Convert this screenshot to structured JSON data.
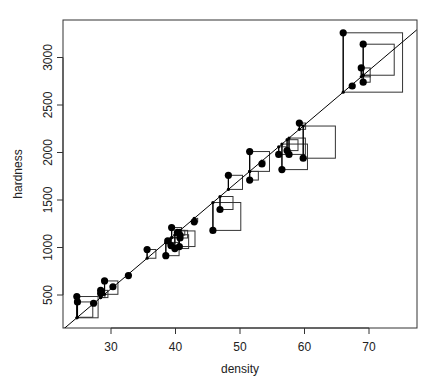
{
  "chart_data": {
    "type": "scatter",
    "title": "",
    "xlabel": "density",
    "ylabel": "hardness",
    "xlim": [
      22.7,
      77.4
    ],
    "ylim": [
      160,
      3345
    ],
    "x_ticks": [
      30,
      40,
      50,
      60,
      70
    ],
    "y_ticks": [
      500,
      1000,
      1500,
      2000,
      2500,
      3000
    ],
    "grid": false,
    "legend": null,
    "regression_line": {
      "intercept": -1160.5,
      "slope": 57.51
    },
    "annotations": "Squared residuals drawn as squares from each observed point to the fitted line; small dots mark fitted values on the line",
    "series": [
      {
        "name": "observations",
        "x": [
          24.7,
          24.8,
          27.3,
          28.4,
          28.4,
          29.0,
          30.3,
          32.7,
          35.6,
          38.5,
          38.8,
          39.3,
          39.4,
          39.9,
          40.3,
          40.6,
          40.7,
          40.7,
          42.9,
          45.8,
          46.9,
          48.2,
          51.5,
          51.5,
          53.4,
          56.0,
          56.5,
          57.3,
          57.6,
          59.2,
          59.8,
          66.0,
          67.4,
          68.8,
          69.1,
          69.1
        ],
        "y": [
          484,
          427,
          413,
          517,
          549,
          648,
          587,
          704,
          979,
          914,
          1070,
          1020,
          1210,
          989,
          1160,
          1010,
          1100,
          1130,
          1270,
          1180,
          1400,
          1760,
          1710,
          2010,
          1880,
          1980,
          1820,
          2020,
          1980,
          2310,
          1940,
          3260,
          2700,
          2890,
          2740,
          3140
        ]
      }
    ]
  },
  "axes": {
    "xlabel": "density",
    "ylabel": "hardness",
    "x_tick_labels": [
      "30",
      "40",
      "50",
      "60",
      "70"
    ],
    "y_tick_labels": [
      "500",
      "1000",
      "1500",
      "2000",
      "2500",
      "3000"
    ]
  },
  "colors": {
    "points": "#000000",
    "line": "#000000",
    "squares": "#333333",
    "frame": "#333333"
  }
}
